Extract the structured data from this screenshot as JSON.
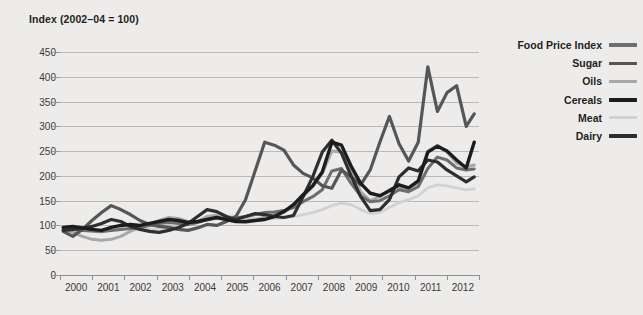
{
  "chart": {
    "axis_title": "Index (2002–04 = 100)"
  },
  "legend": {
    "items": [
      {
        "label": "Food Price Index",
        "color": "#6e6e6e",
        "width": 3.0
      },
      {
        "label": "Sugar",
        "color": "#565656",
        "width": 3.2
      },
      {
        "label": "Oils",
        "color": "#a8a8a8",
        "width": 3.0
      },
      {
        "label": "Cereals",
        "color": "#1c1c1c",
        "width": 3.4
      },
      {
        "label": "Meat",
        "color": "#d2d2d2",
        "width": 2.8
      },
      {
        "label": "Dairy",
        "color": "#2e2e2e",
        "width": 3.2
      }
    ]
  },
  "chart_data": {
    "type": "line",
    "title": "Index (2002–04 = 100)",
    "xlabel": "",
    "ylabel": "Index (2002–04 = 100)",
    "ylim": [
      0,
      450
    ],
    "yticks": [
      0,
      50,
      100,
      150,
      200,
      250,
      300,
      350,
      400,
      450
    ],
    "xlim": [
      1999.5,
      2012.6
    ],
    "xticks": [
      2000,
      2001,
      2002,
      2003,
      2004,
      2005,
      2006,
      2007,
      2008,
      2009,
      2010,
      2011,
      2012
    ],
    "xtick_labels": [
      "2000",
      "2001",
      "2002",
      "2003",
      "2004",
      "2005",
      "2006",
      "2007",
      "2008",
      "2009",
      "2010",
      "2011",
      "2012"
    ],
    "grid": "horizontal",
    "legend_position": "right",
    "x": [
      1999.6,
      1999.9,
      2000.2,
      2000.5,
      2000.8,
      2001.1,
      2001.4,
      2001.7,
      2002.0,
      2002.3,
      2002.6,
      2002.9,
      2003.2,
      2003.5,
      2003.8,
      2004.1,
      2004.4,
      2004.7,
      2005.0,
      2005.3,
      2005.6,
      2005.9,
      2006.2,
      2006.5,
      2006.8,
      2007.1,
      2007.4,
      2007.7,
      2008.0,
      2008.3,
      2008.6,
      2008.9,
      2009.2,
      2009.5,
      2009.8,
      2010.1,
      2010.4,
      2010.7,
      2011.0,
      2011.3,
      2011.6,
      2011.9,
      2012.2,
      2012.45
    ],
    "series": [
      {
        "name": "Food Price Index",
        "color": "#6e6e6e",
        "values": [
          91,
          92,
          90,
          89,
          88,
          90,
          92,
          94,
          96,
          100,
          104,
          106,
          104,
          102,
          106,
          112,
          115,
          113,
          115,
          118,
          122,
          126,
          127,
          130,
          136,
          148,
          158,
          172,
          210,
          215,
          185,
          160,
          148,
          150,
          160,
          172,
          168,
          178,
          215,
          238,
          232,
          216,
          212,
          214
        ]
      },
      {
        "name": "Sugar",
        "color": "#565656",
        "values": [
          88,
          78,
          92,
          110,
          126,
          140,
          132,
          122,
          110,
          102,
          98,
          96,
          92,
          90,
          95,
          102,
          100,
          108,
          118,
          152,
          210,
          268,
          262,
          252,
          222,
          205,
          196,
          180,
          175,
          212,
          198,
          182,
          212,
          268,
          320,
          265,
          230,
          268,
          420,
          330,
          368,
          382,
          300,
          325
        ]
      },
      {
        "name": "Oils",
        "color": "#a8a8a8",
        "values": [
          92,
          86,
          78,
          72,
          70,
          72,
          78,
          88,
          96,
          102,
          110,
          116,
          114,
          108,
          108,
          118,
          120,
          112,
          108,
          106,
          110,
          118,
          122,
          126,
          140,
          158,
          178,
          205,
          250,
          248,
          210,
          168,
          150,
          158,
          172,
          178,
          170,
          186,
          250,
          262,
          248,
          226,
          218,
          222
        ]
      },
      {
        "name": "Cereals",
        "color": "#1c1c1c",
        "values": [
          96,
          98,
          95,
          92,
          90,
          96,
          100,
          102,
          100,
          104,
          108,
          112,
          110,
          106,
          108,
          112,
          116,
          112,
          108,
          108,
          110,
          112,
          118,
          128,
          142,
          162,
          180,
          208,
          268,
          262,
          220,
          185,
          165,
          160,
          170,
          182,
          176,
          190,
          248,
          260,
          250,
          232,
          216,
          268
        ]
      },
      {
        "name": "Meat",
        "color": "#d2d2d2",
        "values": [
          92,
          94,
          92,
          88,
          86,
          92,
          98,
          102,
          96,
          92,
          94,
          96,
          98,
          100,
          108,
          118,
          122,
          120,
          118,
          116,
          114,
          112,
          114,
          116,
          118,
          122,
          126,
          132,
          140,
          145,
          142,
          132,
          124,
          126,
          136,
          146,
          152,
          160,
          176,
          182,
          180,
          176,
          172,
          174
        ]
      },
      {
        "name": "Dairy",
        "color": "#2e2e2e",
        "values": [
          90,
          92,
          94,
          98,
          104,
          112,
          108,
          98,
          92,
          88,
          86,
          90,
          96,
          104,
          118,
          132,
          128,
          118,
          112,
          118,
          124,
          122,
          118,
          116,
          120,
          158,
          198,
          248,
          272,
          246,
          200,
          158,
          130,
          132,
          152,
          198,
          216,
          210,
          232,
          228,
          212,
          200,
          188,
          198
        ]
      }
    ]
  }
}
